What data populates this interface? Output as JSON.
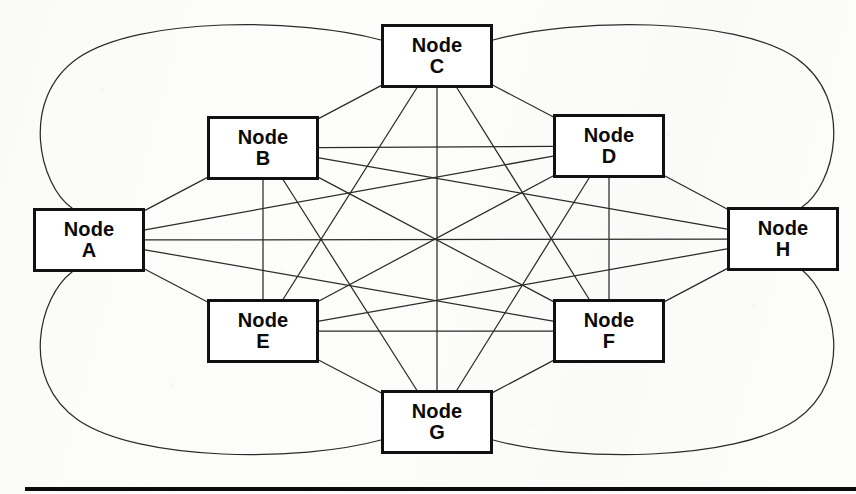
{
  "figure": {
    "type": "graph-diagram",
    "node_shape": "rectangle",
    "edge_style": "straight lines with curved outer arcs",
    "colors": {
      "background": "#fdfdfc",
      "node_border": "#111111",
      "node_fill": "#ffffff",
      "edge": "#2b2b2b",
      "rule": "#0b0b0b",
      "text": "#0a0a0a"
    },
    "bottom_rule_label": ""
  },
  "nodes": [
    {
      "id": "A",
      "label_top": "Node",
      "label_bottom": "A",
      "x": 33,
      "y": 208,
      "w": 112,
      "h": 64
    },
    {
      "id": "B",
      "label_top": "Node",
      "label_bottom": "B",
      "x": 207,
      "y": 116,
      "w": 112,
      "h": 64
    },
    {
      "id": "C",
      "label_top": "Node",
      "label_bottom": "C",
      "x": 381,
      "y": 24,
      "w": 112,
      "h": 64
    },
    {
      "id": "D",
      "label_top": "Node",
      "label_bottom": "D",
      "x": 553,
      "y": 114,
      "w": 112,
      "h": 64
    },
    {
      "id": "E",
      "label_top": "Node",
      "label_bottom": "E",
      "x": 207,
      "y": 299,
      "w": 112,
      "h": 64
    },
    {
      "id": "F",
      "label_top": "Node",
      "label_bottom": "F",
      "x": 553,
      "y": 299,
      "w": 112,
      "h": 64
    },
    {
      "id": "G",
      "label_top": "Node",
      "label_bottom": "G",
      "x": 381,
      "y": 390,
      "w": 112,
      "h": 64
    },
    {
      "id": "H",
      "label_top": "Node",
      "label_bottom": "H",
      "x": 727,
      "y": 207,
      "w": 112,
      "h": 64
    }
  ],
  "edges": [
    {
      "from": "A",
      "to": "B",
      "kind": "line"
    },
    {
      "from": "A",
      "to": "C",
      "kind": "arc",
      "bow": "left-top"
    },
    {
      "from": "A",
      "to": "D",
      "kind": "line"
    },
    {
      "from": "A",
      "to": "E",
      "kind": "line"
    },
    {
      "from": "A",
      "to": "F",
      "kind": "line"
    },
    {
      "from": "A",
      "to": "G",
      "kind": "arc",
      "bow": "left-bottom"
    },
    {
      "from": "A",
      "to": "H",
      "kind": "line"
    },
    {
      "from": "B",
      "to": "C",
      "kind": "line"
    },
    {
      "from": "B",
      "to": "D",
      "kind": "line"
    },
    {
      "from": "B",
      "to": "E",
      "kind": "line"
    },
    {
      "from": "B",
      "to": "F",
      "kind": "line"
    },
    {
      "from": "B",
      "to": "G",
      "kind": "line"
    },
    {
      "from": "B",
      "to": "H",
      "kind": "line"
    },
    {
      "from": "C",
      "to": "D",
      "kind": "line"
    },
    {
      "from": "C",
      "to": "E",
      "kind": "line"
    },
    {
      "from": "C",
      "to": "F",
      "kind": "line"
    },
    {
      "from": "C",
      "to": "G",
      "kind": "line"
    },
    {
      "from": "C",
      "to": "H",
      "kind": "arc",
      "bow": "right-top"
    },
    {
      "from": "D",
      "to": "E",
      "kind": "line"
    },
    {
      "from": "D",
      "to": "F",
      "kind": "line"
    },
    {
      "from": "D",
      "to": "G",
      "kind": "line"
    },
    {
      "from": "D",
      "to": "H",
      "kind": "line"
    },
    {
      "from": "E",
      "to": "F",
      "kind": "line"
    },
    {
      "from": "E",
      "to": "G",
      "kind": "line"
    },
    {
      "from": "E",
      "to": "H",
      "kind": "line"
    },
    {
      "from": "F",
      "to": "G",
      "kind": "line"
    },
    {
      "from": "F",
      "to": "H",
      "kind": "line"
    },
    {
      "from": "G",
      "to": "H",
      "kind": "arc",
      "bow": "right-bottom"
    }
  ],
  "arcs": [
    {
      "id": "A-C",
      "d": "M 72 208 C 40 186 18 100 78 58 C 140 16 300 18 381 40"
    },
    {
      "id": "C-H",
      "d": "M 493 40 C 574 18 734 16 796 58 C 856 100 834 186 802 207"
    },
    {
      "id": "A-G",
      "d": "M 72 272 C 40 296 18 378 78 420 C 140 462 300 462 381 440"
    },
    {
      "id": "G-H",
      "d": "M 493 440 C 574 462 734 462 796 420 C 856 378 834 296 802 270"
    }
  ],
  "chart_data": {
    "type": "diagram",
    "node_count": 8,
    "edge_count": 28,
    "topology": "complete graph K8",
    "node_labels": [
      "Node A",
      "Node B",
      "Node C",
      "Node D",
      "Node E",
      "Node F",
      "Node G",
      "Node H"
    ]
  }
}
